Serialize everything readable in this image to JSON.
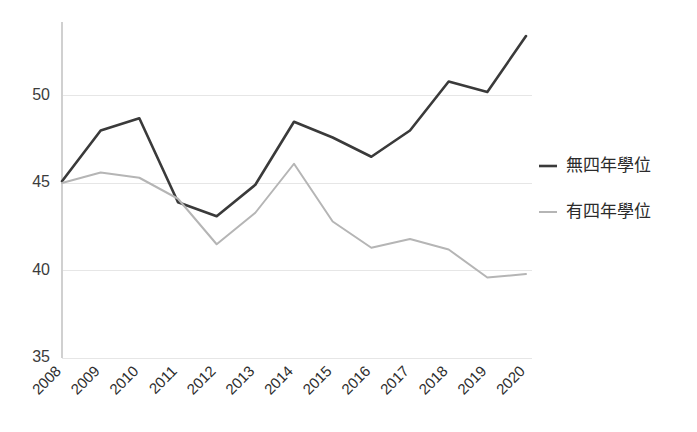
{
  "chart_data": {
    "type": "line",
    "title": "",
    "subtitle": "",
    "xlabel": "",
    "ylabel": "",
    "categories": [
      "2008",
      "2009",
      "2010",
      "2011",
      "2012",
      "2013",
      "2014",
      "2015",
      "2016",
      "2017",
      "2018",
      "2019",
      "2020"
    ],
    "x": [
      2008,
      2009,
      2010,
      2011,
      2012,
      2013,
      2014,
      2015,
      2016,
      2017,
      2018,
      2019,
      2020
    ],
    "series": [
      {
        "name": "無四年學位",
        "color": "#3a3a3a",
        "values": [
          45.1,
          48.0,
          48.7,
          43.9,
          43.1,
          44.9,
          48.5,
          47.6,
          46.5,
          48.0,
          50.8,
          50.2,
          53.4
        ]
      },
      {
        "name": "有四年學位",
        "color": "#b5b5b5",
        "values": [
          45.0,
          45.6,
          45.3,
          44.1,
          41.5,
          43.3,
          46.1,
          42.8,
          41.3,
          41.8,
          41.2,
          39.6,
          39.8
        ]
      }
    ],
    "ylim": [
      35,
      54.2
    ],
    "yticks": [
      35,
      40,
      45,
      50
    ],
    "ytick_labels": [
      "35",
      "40",
      "45",
      "50"
    ],
    "xtick_labels": [
      "2008",
      "2009",
      "2010",
      "2011",
      "2012",
      "2013",
      "2014",
      "2015",
      "2016",
      "2017",
      "2018",
      "2019",
      "2020"
    ],
    "grid": true,
    "grid_color": "#e6e6e6",
    "axis_color": "#d0d0d0",
    "legend_position": "right",
    "legend": [
      {
        "label": "無四年學位",
        "color": "#3a3a3a",
        "width": 2.6
      },
      {
        "label": "有四年學位",
        "color": "#b5b5b5",
        "width": 2.0
      }
    ]
  },
  "axes": {
    "y": {
      "tick_0": "35",
      "tick_1": "40",
      "tick_2": "45",
      "tick_3": "50"
    },
    "x": {
      "tick_0": "2008",
      "tick_1": "2009",
      "tick_2": "2010",
      "tick_3": "2011",
      "tick_4": "2012",
      "tick_5": "2013",
      "tick_6": "2014",
      "tick_7": "2015",
      "tick_8": "2016",
      "tick_9": "2017",
      "tick_10": "2018",
      "tick_11": "2019",
      "tick_12": "2020"
    }
  },
  "legend": {
    "item_0_label": "無四年學位",
    "item_1_label": "有四年學位"
  }
}
